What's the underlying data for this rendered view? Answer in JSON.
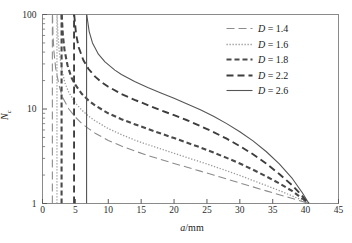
{
  "chart_data": {
    "type": "line",
    "title": "",
    "xlabel": "a/mm",
    "ylabel": "N_c",
    "xlabel_parts": {
      "italic": "a",
      "rest": "/mm"
    },
    "ylabel_parts": {
      "main": "N",
      "sub": "c"
    },
    "yscale": "log",
    "xscale": "linear",
    "xlim": [
      0,
      45
    ],
    "ylim": [
      1,
      100
    ],
    "xticks": [
      0,
      5,
      10,
      15,
      20,
      25,
      30,
      35,
      40,
      45
    ],
    "xtick_labels": [
      "0",
      "5",
      "10",
      "15",
      "20",
      "25",
      "30",
      "35",
      "40",
      "45"
    ],
    "yticks": [
      1,
      10,
      100
    ],
    "ytick_labels": [
      "1",
      "10",
      "100"
    ],
    "grid": false,
    "legend_position": "upper right",
    "convergence_point": {
      "a": 40.5,
      "N": 1
    },
    "series": [
      {
        "name": "D = 1.4",
        "label_parts": {
          "symbol": "D",
          "value": "= 1.4"
        },
        "D": 1.4,
        "dash": "8,4",
        "width": 1.1,
        "color": "#8c8c8c",
        "asymptote": 1.5,
        "points": [
          [
            1.52,
            100
          ],
          [
            1.6,
            60
          ],
          [
            1.75,
            40
          ],
          [
            2.0,
            27
          ],
          [
            2.5,
            18
          ],
          [
            3.0,
            13.5
          ],
          [
            4.0,
            10.0
          ],
          [
            5.0,
            8.2
          ],
          [
            6.0,
            7.0
          ],
          [
            7.0,
            6.2
          ],
          [
            8.0,
            5.55
          ],
          [
            10.0,
            4.65
          ],
          [
            12.0,
            4.05
          ],
          [
            14.0,
            3.6
          ],
          [
            16.0,
            3.22
          ],
          [
            18.0,
            2.92
          ],
          [
            20.0,
            2.65
          ],
          [
            22.0,
            2.42
          ],
          [
            24.0,
            2.2
          ],
          [
            26.0,
            2.0
          ],
          [
            28.0,
            1.82
          ],
          [
            30.0,
            1.65
          ],
          [
            32.0,
            1.5
          ],
          [
            34.0,
            1.36
          ],
          [
            36.0,
            1.24
          ],
          [
            38.0,
            1.13
          ],
          [
            39.5,
            1.05
          ],
          [
            40.5,
            1.0
          ]
        ]
      },
      {
        "name": "D = 1.6",
        "label_parts": {
          "symbol": "D",
          "value": "= 1.6"
        },
        "D": 1.6,
        "dash": "1.3,1.7",
        "width": 1.3,
        "color": "#9a9a9a",
        "asymptote": 2.2,
        "points": [
          [
            2.22,
            100
          ],
          [
            2.35,
            60
          ],
          [
            2.55,
            40
          ],
          [
            2.9,
            27
          ],
          [
            3.4,
            19
          ],
          [
            4.0,
            15
          ],
          [
            5.0,
            11.6
          ],
          [
            6.0,
            9.7
          ],
          [
            7.0,
            8.4
          ],
          [
            8.0,
            7.5
          ],
          [
            10.0,
            6.2
          ],
          [
            12.0,
            5.35
          ],
          [
            14.0,
            4.7
          ],
          [
            16.0,
            4.2
          ],
          [
            18.0,
            3.78
          ],
          [
            20.0,
            3.4
          ],
          [
            22.0,
            3.06
          ],
          [
            24.0,
            2.76
          ],
          [
            26.0,
            2.48
          ],
          [
            28.0,
            2.22
          ],
          [
            30.0,
            1.98
          ],
          [
            32.0,
            1.75
          ],
          [
            34.0,
            1.55
          ],
          [
            36.0,
            1.37
          ],
          [
            38.0,
            1.2
          ],
          [
            39.5,
            1.08
          ],
          [
            40.5,
            1.0
          ]
        ]
      },
      {
        "name": "D = 1.8",
        "label_parts": {
          "symbol": "D",
          "value": "= 1.8"
        },
        "D": 1.8,
        "dash": "5,3",
        "width": 2.1,
        "color": "#4a4a4a",
        "asymptote": 2.9,
        "points": [
          [
            2.92,
            100
          ],
          [
            3.1,
            60
          ],
          [
            3.35,
            42
          ],
          [
            3.8,
            29
          ],
          [
            4.4,
            21.5
          ],
          [
            5.0,
            18
          ],
          [
            6.0,
            14.4
          ],
          [
            7.0,
            12.3
          ],
          [
            8.0,
            10.9
          ],
          [
            10.0,
            9.0
          ],
          [
            12.0,
            7.8
          ],
          [
            14.0,
            6.9
          ],
          [
            16.0,
            6.15
          ],
          [
            18.0,
            5.5
          ],
          [
            20.0,
            4.92
          ],
          [
            22.0,
            4.4
          ],
          [
            24.0,
            3.92
          ],
          [
            26.0,
            3.46
          ],
          [
            28.0,
            3.04
          ],
          [
            30.0,
            2.65
          ],
          [
            32.0,
            2.28
          ],
          [
            34.0,
            1.94
          ],
          [
            36.0,
            1.63
          ],
          [
            38.0,
            1.35
          ],
          [
            39.5,
            1.13
          ],
          [
            40.5,
            1.0
          ]
        ]
      },
      {
        "name": "D = 2.2",
        "label_parts": {
          "symbol": "D",
          "value": "= 2.2"
        },
        "D": 2.2,
        "dash": "7,4",
        "width": 1.9,
        "color": "#3d3d3d",
        "asymptote": 4.8,
        "points": [
          [
            4.82,
            100
          ],
          [
            5.1,
            62
          ],
          [
            5.5,
            45
          ],
          [
            6.2,
            33
          ],
          [
            7.0,
            26.5
          ],
          [
            8.0,
            22.0
          ],
          [
            9.0,
            19.2
          ],
          [
            10.0,
            17.2
          ],
          [
            12.0,
            14.4
          ],
          [
            14.0,
            12.5
          ],
          [
            16.0,
            11.0
          ],
          [
            18.0,
            9.7
          ],
          [
            20.0,
            8.6
          ],
          [
            22.0,
            7.6
          ],
          [
            24.0,
            6.6
          ],
          [
            26.0,
            5.7
          ],
          [
            28.0,
            4.85
          ],
          [
            30.0,
            4.05
          ],
          [
            32.0,
            3.32
          ],
          [
            34.0,
            2.65
          ],
          [
            36.0,
            2.05
          ],
          [
            38.0,
            1.55
          ],
          [
            39.5,
            1.2
          ],
          [
            40.5,
            1.0
          ]
        ]
      },
      {
        "name": "D = 2.6",
        "label_parts": {
          "symbol": "D",
          "value": "= 2.6"
        },
        "D": 2.6,
        "dash": "",
        "width": 1.1,
        "color": "#555555",
        "asymptote": 6.7,
        "points": [
          [
            6.72,
            100
          ],
          [
            7.1,
            66
          ],
          [
            7.6,
            50
          ],
          [
            8.5,
            38
          ],
          [
            9.5,
            31.5
          ],
          [
            11.0,
            25.8
          ],
          [
            12.0,
            23.2
          ],
          [
            14.0,
            19.5
          ],
          [
            16.0,
            16.9
          ],
          [
            18.0,
            14.8
          ],
          [
            20.0,
            13.0
          ],
          [
            22.0,
            11.3
          ],
          [
            24.0,
            9.8
          ],
          [
            26.0,
            8.4
          ],
          [
            28.0,
            7.0
          ],
          [
            30.0,
            5.75
          ],
          [
            32.0,
            4.6
          ],
          [
            34.0,
            3.55
          ],
          [
            36.0,
            2.62
          ],
          [
            38.0,
            1.83
          ],
          [
            39.5,
            1.3
          ],
          [
            40.5,
            1.0
          ]
        ]
      }
    ]
  },
  "axes": {
    "frame_color": "#8a8a8a",
    "tick_color": "#5a5a5a"
  }
}
